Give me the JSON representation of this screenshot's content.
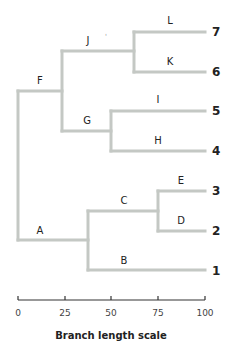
{
  "diagram": {
    "type": "phylogenetic-tree",
    "branch_color": "#c4c8c4",
    "internal_labels": {
      "A": "A",
      "B": "B",
      "C": "C",
      "D": "D",
      "E": "E",
      "F": "F",
      "G": "G",
      "H": "H",
      "I": "I",
      "J": "J",
      "K": "K",
      "L": "L"
    },
    "leaves": {
      "l7": "7",
      "l6": "6",
      "l5": "5",
      "l4": "4",
      "l3": "3",
      "l2": "2",
      "l1": "1"
    },
    "stray_mark": "'",
    "axis": {
      "title": "Branch length scale",
      "ticks": [
        "0",
        "25",
        "50",
        "75",
        "100"
      ],
      "range": [
        0,
        100
      ]
    },
    "topology": "((7:L,6:K):J,(5:I,4:H):G):F,((3:E,2:D):C,1:B):A"
  }
}
